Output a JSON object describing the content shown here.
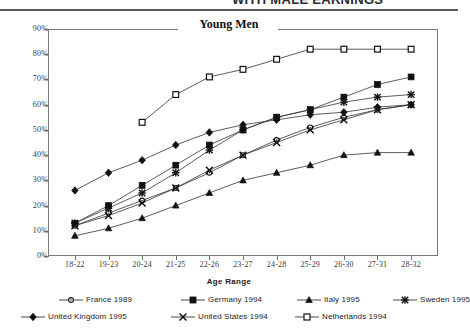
{
  "page": {
    "cut_off_header": "WITH MALE EARNINGS"
  },
  "chart_data": {
    "type": "line",
    "title": "Young Men",
    "xlabel": "Age Range",
    "ylabel": "",
    "categories": [
      "18-22",
      "19-23",
      "20-24",
      "21-25",
      "22-26",
      "23-27",
      "24-28",
      "25-29",
      "26-30",
      "27-31",
      "28-32"
    ],
    "ylim": [
      0,
      90
    ],
    "ytick_labels": [
      "0%",
      "10%",
      "20%",
      "30%",
      "40%",
      "50%",
      "60%",
      "70%",
      "80%",
      "90%"
    ],
    "ytick_values": [
      0,
      10,
      20,
      30,
      40,
      50,
      60,
      70,
      80,
      90
    ],
    "grid": false,
    "legend_position": "bottom",
    "series": [
      {
        "name": "France 1989",
        "marker": "open-circle",
        "values": [
          12,
          17,
          22,
          27,
          33,
          40,
          46,
          51,
          55,
          58,
          60
        ]
      },
      {
        "name": "Germany 1994",
        "marker": "filled-square",
        "values": [
          13,
          20,
          28,
          36,
          44,
          50,
          55,
          58,
          63,
          68,
          71
        ]
      },
      {
        "name": "Italy 1995",
        "marker": "filled-triangle",
        "values": [
          8,
          11,
          15,
          20,
          25,
          30,
          33,
          36,
          40,
          41,
          41
        ]
      },
      {
        "name": "Sweden 1995",
        "marker": "asterisk",
        "values": [
          13,
          19,
          25,
          33,
          42,
          50,
          55,
          58,
          61,
          63,
          64
        ]
      },
      {
        "name": "United Kingdom 1995",
        "marker": "filled-diamond",
        "values": [
          26,
          33,
          38,
          44,
          49,
          52,
          54,
          56,
          57,
          59,
          60
        ]
      },
      {
        "name": "United States 1994",
        "marker": "cross-x",
        "values": [
          12,
          16,
          21,
          27,
          34,
          40,
          45,
          50,
          54,
          58,
          60
        ]
      },
      {
        "name": "Netherlands 1994",
        "marker": "open-square",
        "values": [
          null,
          null,
          53,
          64,
          71,
          74,
          78,
          82,
          82,
          82,
          82
        ]
      }
    ]
  }
}
